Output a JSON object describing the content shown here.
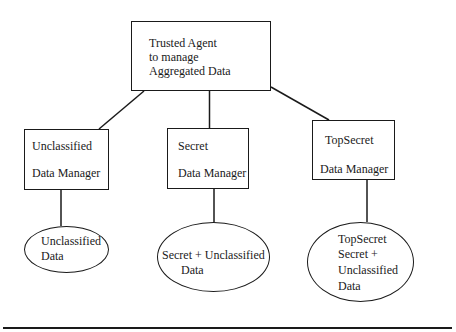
{
  "diagram": {
    "type": "hierarchy",
    "root": {
      "lines": [
        "Trusted Agent",
        "to manage",
        "Aggregated Data"
      ]
    },
    "managers": [
      {
        "lines": [
          "Unclassified",
          "Data Manager"
        ]
      },
      {
        "lines": [
          "Secret",
          "Data Manager"
        ]
      },
      {
        "lines": [
          "TopSecret",
          "Data Manager"
        ]
      }
    ],
    "data_stores": [
      {
        "lines": [
          "Unclassified",
          "Data"
        ]
      },
      {
        "lines": [
          "Secret + Unclassified",
          "Data"
        ]
      },
      {
        "lines": [
          "TopSecret",
          "Secret +",
          "Unclassified",
          "Data"
        ]
      }
    ],
    "edges": [
      [
        "root",
        "managers.0"
      ],
      [
        "root",
        "managers.1"
      ],
      [
        "root",
        "managers.2"
      ],
      [
        "managers.0",
        "data_stores.0"
      ],
      [
        "managers.1",
        "data_stores.1"
      ],
      [
        "managers.2",
        "data_stores.2"
      ]
    ],
    "colors": {
      "stroke": "#1a1a1a",
      "background": "#ffffff"
    }
  }
}
